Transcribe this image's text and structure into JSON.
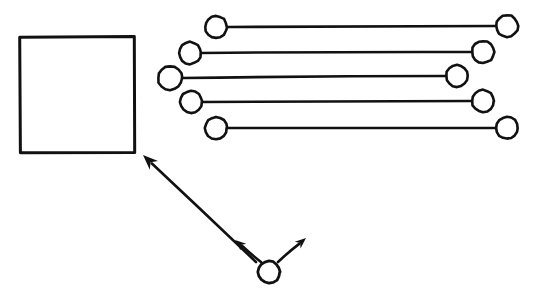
{
  "diagram": {
    "background_color": "#ffffff",
    "ink_color": "#111111",
    "canvas": {
      "width": 538,
      "height": 303
    },
    "square": {
      "label": "square",
      "x": 19,
      "y": 37,
      "width": 116,
      "height": 115,
      "stroke_width": 3
    },
    "dumbbells": {
      "label": "dumbbell-group",
      "count": 5,
      "stroke_width": 2.6,
      "circle_stroke_width": 2.6,
      "items": [
        {
          "label": "dumbbell-row-1",
          "left_cx": 216,
          "left_cy": 27,
          "left_r": 11,
          "right_cx": 507,
          "right_cy": 26,
          "right_r": 11
        },
        {
          "label": "dumbbell-row-2",
          "left_cx": 190,
          "left_cy": 53,
          "left_r": 11,
          "right_cx": 483,
          "right_cy": 52,
          "right_r": 11
        },
        {
          "label": "dumbbell-row-3",
          "left_cx": 170,
          "left_cy": 78,
          "left_r": 12,
          "right_cx": 457,
          "right_cy": 76,
          "right_r": 11
        },
        {
          "label": "dumbbell-row-4",
          "left_cx": 191,
          "left_cy": 102,
          "left_r": 11,
          "right_cx": 483,
          "right_cy": 101,
          "right_r": 11
        },
        {
          "label": "dumbbell-row-5",
          "left_cx": 216,
          "left_cy": 128,
          "left_r": 11,
          "right_cx": 507,
          "right_cy": 128,
          "right_r": 11
        }
      ]
    },
    "hub": {
      "label": "hub-circle",
      "cx": 269,
      "cy": 272,
      "r": 11,
      "stroke_width": 2.8
    },
    "arrows": {
      "label": "arrow-group",
      "count": 3,
      "stroke_width": 2.6,
      "items": [
        {
          "label": "arrow-to-square",
          "direction": "up-left-long",
          "from_x": 256,
          "from_y": 262,
          "to_x": 143,
          "to_y": 155,
          "length_px": 155
        },
        {
          "label": "arrow-up-left-short",
          "direction": "up-left-short",
          "from_x": 261,
          "from_y": 262,
          "to_x": 235,
          "to_y": 240,
          "length_px": 34
        },
        {
          "label": "arrow-up-right-short",
          "direction": "up-right-short",
          "from_x": 278,
          "from_y": 262,
          "to_x": 306,
          "to_y": 238,
          "length_px": 37
        }
      ]
    }
  }
}
